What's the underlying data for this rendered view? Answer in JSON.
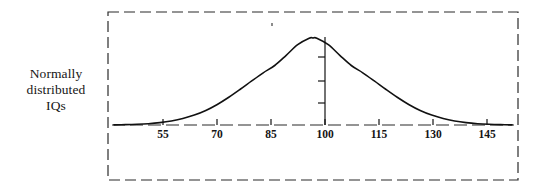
{
  "figure": {
    "caption_lines": [
      "Normally",
      "distributed",
      "IQs"
    ],
    "caption_full": "Normally distributed IQs",
    "border_style": "dashed",
    "border_color": "#2b2b2b",
    "background_color": "#ffffff",
    "curve_color": "#111111",
    "axis_color": "#2b2b2b"
  },
  "chart_data": {
    "type": "line",
    "title": "Normally distributed IQs",
    "xlabel": "",
    "ylabel": "",
    "subtitle": "",
    "grid": false,
    "legend": "none",
    "xlim": [
      47.5,
      152.5
    ],
    "ylim": [
      0,
      1
    ],
    "x_ticks": [
      55,
      70,
      85,
      100,
      115,
      130,
      145
    ],
    "x_tick_labels": [
      "55",
      "70",
      "85",
      "100",
      "115",
      "130",
      "145"
    ],
    "y_ticks": [],
    "y_tick_labels": [],
    "distribution": {
      "name": "normal",
      "mean": 100,
      "std_dev": 15,
      "mean_line": true,
      "mean_line_value": 100,
      "mean_line_ticks": 3
    },
    "series": [
      {
        "name": "Normal distribution of IQ",
        "x": [
          48,
          51,
          54,
          57,
          60,
          63,
          66,
          69,
          72,
          75,
          78,
          81,
          84,
          87,
          90,
          93,
          96,
          99,
          100,
          101,
          104,
          107,
          110,
          113,
          116,
          119,
          122,
          125,
          128,
          131,
          134,
          137,
          140,
          143,
          146,
          149,
          152
        ],
        "values": [
          0.002,
          0.004,
          0.008,
          0.015,
          0.027,
          0.046,
          0.074,
          0.114,
          0.167,
          0.236,
          0.319,
          0.411,
          0.507,
          0.6,
          0.684,
          0.801,
          0.923,
          0.998,
          1.0,
          0.998,
          0.923,
          0.801,
          0.684,
          0.6,
          0.507,
          0.411,
          0.319,
          0.236,
          0.167,
          0.114,
          0.074,
          0.046,
          0.027,
          0.015,
          0.008,
          0.004,
          0.002
        ]
      }
    ],
    "annotations": []
  }
}
